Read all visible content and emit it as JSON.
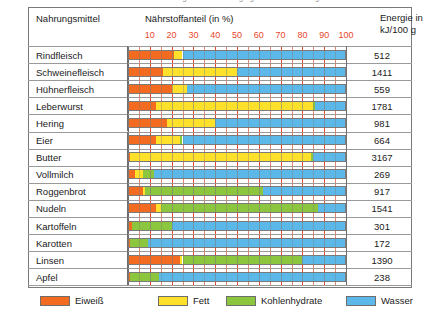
{
  "page": {
    "cut_off_top_text": "Nährstoffgehalt und Energiegehalt von Nahrungsmitteln"
  },
  "header": {
    "food_column": "Nahrungsmittel",
    "nutrient_column": "Nährstoffanteil (in %)",
    "energy_column_line1": "Energie in",
    "energy_column_line2": "kJ/100 g"
  },
  "legend": {
    "position": "bottom",
    "items": [
      {
        "label": "Eiweiß",
        "key": "protein",
        "color": "#F26B21"
      },
      {
        "label": "Fett",
        "key": "fat",
        "color": "#FFE02B"
      },
      {
        "label": "Kohlenhydrate",
        "key": "carb",
        "color": "#8CC63E"
      },
      {
        "label": "Wasser",
        "key": "water",
        "color": "#5BB8E8"
      }
    ]
  },
  "chart_data": {
    "type": "bar",
    "orientation": "horizontal",
    "stacked": true,
    "title": "Nährstoffanteil (in %)",
    "xlabel": "Nährstoffanteil (in %)",
    "ylabel": "Nahrungsmittel",
    "xlim": [
      0,
      100
    ],
    "xticks": [
      10,
      20,
      30,
      40,
      50,
      60,
      70,
      80,
      90,
      100
    ],
    "grid": true,
    "tick_color": "#E8472B",
    "categories": [
      "Rindfleisch",
      "Schweinefleisch",
      "Hühnerfleisch",
      "Leberwurst",
      "Hering",
      "Eier",
      "Butter",
      "Vollmilch",
      "Roggenbrot",
      "Nudeln",
      "Kartoffeln",
      "Karotten",
      "Linsen",
      "Apfel"
    ],
    "series": [
      {
        "name": "Eiweiß",
        "key": "protein",
        "values": [
          21,
          16,
          20,
          13,
          18,
          13,
          1,
          3,
          7,
          13,
          2,
          1,
          24,
          1
        ]
      },
      {
        "name": "Fett",
        "key": "fat",
        "values": [
          4,
          34,
          7,
          72,
          22,
          11,
          83,
          4,
          1,
          2,
          0,
          0,
          1,
          0
        ]
      },
      {
        "name": "Kohlenhydrate",
        "key": "carb",
        "values": [
          0,
          0,
          0,
          1,
          0,
          1,
          1,
          5,
          54,
          72,
          18,
          8,
          55,
          13
        ]
      },
      {
        "name": "Wasser",
        "key": "water",
        "values": [
          75,
          50,
          73,
          14,
          60,
          75,
          15,
          88,
          38,
          13,
          80,
          91,
          20,
          86
        ]
      }
    ],
    "energy_label": "Energie in kJ/100 g",
    "energy_unit": "kJ/100 g",
    "energy_values": [
      512,
      1411,
      559,
      1781,
      981,
      664,
      3167,
      269,
      917,
      1541,
      301,
      172,
      1390,
      238
    ]
  }
}
